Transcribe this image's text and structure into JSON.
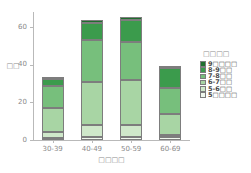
{
  "chart_data": {
    "type": "bar",
    "subtype": "stacked-bar",
    "title": "",
    "xlabel": "□□□□",
    "ylabel": "□□",
    "categories": [
      "30-39",
      "40-49",
      "50-59",
      "60-69"
    ],
    "ylim": [
      0,
      68
    ],
    "yticks": [
      0,
      20,
      40,
      60
    ],
    "ytick_labels": [
      "0",
      "20",
      "40",
      "60"
    ],
    "grid": false,
    "legend_position": "right",
    "legend_title": "□□□□",
    "stack_order_bottom_to_top": [
      "5□□□□",
      "5-6□□",
      "6-7□□",
      "7-8□□",
      "8-9□□",
      "9□□□□"
    ],
    "series": [
      {
        "name": "9□□□□",
        "color": "#1f6f2e",
        "values": [
          1.0,
          1.5,
          2.0,
          1.0
        ]
      },
      {
        "name": "8-9□□",
        "color": "#3b9b4c",
        "values": [
          4.0,
          9.0,
          11.5,
          11.0
        ]
      },
      {
        "name": "7-8□□",
        "color": "#77bf7c",
        "values": [
          11.5,
          22.0,
          20.0,
          13.5
        ]
      },
      {
        "name": "6-7□□",
        "color": "#a8d5a4",
        "values": [
          13.0,
          23.0,
          24.0,
          11.5
        ]
      },
      {
        "name": "5-6□□",
        "color": "#cfe8ca",
        "values": [
          3.0,
          6.5,
          6.5,
          1.0
        ]
      },
      {
        "name": "5□□□□",
        "color": "#f0f8ee",
        "values": [
          1.0,
          1.5,
          1.5,
          1.5
        ]
      }
    ],
    "totals": [
      33.5,
      63.5,
      65.5,
      39.5
    ]
  },
  "axes": {
    "y_label": "□□",
    "x_label": "□□□□"
  },
  "legend": {
    "title": "□□□□",
    "entries": [
      {
        "label": "9□□□□",
        "color": "#1f6f2e"
      },
      {
        "label": "8-9□□",
        "color": "#3b9b4c"
      },
      {
        "label": "7-8□□",
        "color": "#77bf7c"
      },
      {
        "label": "6-7□□",
        "color": "#a8d5a4"
      },
      {
        "label": "5-6□□",
        "color": "#cfe8ca"
      },
      {
        "label": "5□□□□",
        "color": "#f0f8ee"
      }
    ]
  },
  "style": {
    "axis_color": "#b9b9b9",
    "tick_text_color": "#8a8a8a",
    "segment_border": "#7d7d7d",
    "background": "#ffffff"
  }
}
